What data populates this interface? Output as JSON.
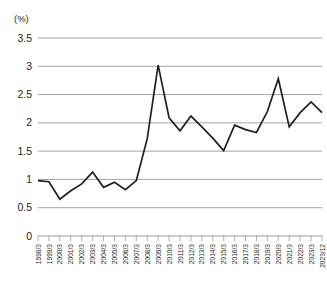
{
  "chart_data": {
    "type": "line",
    "title": "",
    "subtitle": "",
    "unit_label": "(%)",
    "xlabel": "",
    "ylabel": "",
    "ylim": [
      0,
      3.5
    ],
    "ytick_values": [
      0,
      0.5,
      1,
      1.5,
      2,
      2.5,
      3,
      3.5
    ],
    "ytick_labels": [
      "0",
      "0.5",
      "1",
      "1.5",
      "2",
      "2.5",
      "3",
      "3.5"
    ],
    "grid": true,
    "legend": false,
    "legend_position": "none",
    "annotations": [],
    "categories": [
      "1998/3",
      "1999/3",
      "2000/3",
      "2001/3",
      "2002/3",
      "2003/3",
      "2004/3",
      "2005/3",
      "2006/3",
      "2007/3",
      "2008/3",
      "2009/3",
      "2010/3",
      "2011/3",
      "2012/3",
      "2013/3",
      "2014/3",
      "2015/3",
      "2016/3",
      "2017/3",
      "2018/3",
      "2019/3",
      "2020/3",
      "2021/3",
      "2022/3",
      "2023/3",
      "2023/12"
    ],
    "values": [
      0.98,
      0.96,
      0.65,
      0.8,
      0.92,
      1.13,
      0.86,
      0.95,
      0.82,
      0.98,
      1.72,
      3.02,
      2.09,
      1.86,
      2.12,
      1.93,
      1.73,
      1.51,
      1.96,
      1.88,
      1.83,
      2.2,
      2.78,
      1.93,
      2.18,
      2.37,
      2.18
    ],
    "series": [
      {
        "name": "rate",
        "color": "#231f20",
        "values": [
          0.98,
          0.96,
          0.65,
          0.8,
          0.92,
          1.13,
          0.86,
          0.95,
          0.82,
          0.98,
          1.72,
          3.02,
          2.09,
          1.86,
          2.12,
          1.93,
          1.73,
          1.51,
          1.96,
          1.88,
          1.83,
          2.2,
          2.78,
          1.93,
          2.18,
          2.37,
          2.18
        ]
      }
    ],
    "colors": {
      "series": "#231f20",
      "grid": "#8c8c8c",
      "axis": "#8c8c8c",
      "text": "#231f20",
      "background": "#ffffff"
    }
  }
}
